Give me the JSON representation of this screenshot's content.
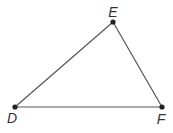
{
  "diagram": {
    "type": "triangle",
    "line_color": "#555555",
    "point_color": "#222222",
    "vertices": [
      {
        "id": "D",
        "label": "D",
        "x": 15,
        "y": 107,
        "label_x": 12,
        "label_y": 123
      },
      {
        "id": "E",
        "label": "E",
        "x": 113,
        "y": 22,
        "label_x": 113,
        "label_y": 17
      },
      {
        "id": "F",
        "label": "F",
        "x": 162,
        "y": 107,
        "label_x": 161,
        "label_y": 124
      }
    ],
    "segments": [
      {
        "from": "D",
        "to": "E"
      },
      {
        "from": "E",
        "to": "F"
      },
      {
        "from": "D",
        "to": "F"
      }
    ]
  }
}
